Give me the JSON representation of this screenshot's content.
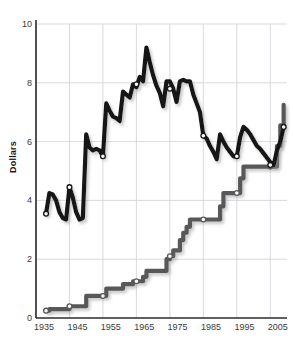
{
  "chart_data": {
    "type": "line",
    "title": "",
    "xlabel": "",
    "ylabel": "Dollars",
    "xlim": [
      1935,
      2010
    ],
    "ylim": [
      0,
      10
    ],
    "grid": true,
    "legend": "none",
    "xticks": [
      1935,
      1945,
      1955,
      1965,
      1975,
      1985,
      1995,
      2005
    ],
    "yticks": [
      0,
      2,
      4,
      6,
      8,
      10
    ],
    "colors": {
      "real_line": "#161616",
      "nominal_line": "#595959",
      "marker_fill": "#ffffff",
      "grid": "#cfcfd8",
      "axis": "#2b2b2b",
      "text": "#333333"
    },
    "series": [
      {
        "name": "Real (inflation-adjusted) minimum wage",
        "color": "#161616",
        "style": "line",
        "x": [
          1938,
          1939,
          1940,
          1941,
          1942,
          1943,
          1944,
          1945,
          1946,
          1947,
          1948,
          1949,
          1950,
          1951,
          1952,
          1953,
          1954,
          1955,
          1956,
          1957,
          1958,
          1959,
          1960,
          1961,
          1962,
          1963,
          1964,
          1965,
          1966,
          1967,
          1968,
          1969,
          1970,
          1971,
          1972,
          1973,
          1974,
          1975,
          1976,
          1977,
          1978,
          1979,
          1980,
          1981,
          1982,
          1983,
          1984,
          1985,
          1986,
          1987,
          1988,
          1989,
          1990,
          1991,
          1992,
          1993,
          1994,
          1995,
          1996,
          1997,
          1998,
          1999,
          2000,
          2001,
          2002,
          2003,
          2004,
          2005,
          2006,
          2007,
          2008,
          2009
        ],
        "y": [
          3.55,
          4.25,
          4.2,
          4.0,
          3.6,
          3.4,
          3.35,
          4.45,
          4.1,
          3.6,
          3.35,
          3.4,
          6.25,
          5.8,
          5.7,
          5.75,
          5.7,
          5.5,
          7.3,
          7.05,
          6.85,
          6.8,
          6.7,
          7.7,
          7.6,
          7.5,
          7.95,
          7.85,
          8.2,
          8.05,
          9.2,
          8.7,
          8.25,
          7.9,
          7.65,
          7.2,
          8.05,
          8.05,
          7.8,
          7.35,
          8.05,
          8.1,
          8.05,
          8.05,
          7.6,
          7.3,
          7.0,
          6.2,
          6.1,
          5.85,
          5.65,
          5.4,
          6.25,
          6.0,
          5.8,
          5.65,
          5.5,
          5.5,
          6.15,
          6.5,
          6.4,
          6.25,
          6.05,
          5.85,
          5.75,
          5.6,
          5.45,
          5.3,
          5.2,
          5.7,
          6.0,
          6.5
        ]
      },
      {
        "name": "Nominal minimum wage",
        "color": "#595959",
        "style": "step",
        "x": [
          1938,
          1939,
          1940,
          1941,
          1942,
          1943,
          1944,
          1945,
          1946,
          1947,
          1948,
          1949,
          1950,
          1951,
          1952,
          1953,
          1954,
          1955,
          1956,
          1957,
          1958,
          1959,
          1960,
          1961,
          1962,
          1963,
          1964,
          1965,
          1966,
          1967,
          1968,
          1969,
          1970,
          1971,
          1972,
          1973,
          1974,
          1975,
          1976,
          1977,
          1978,
          1979,
          1980,
          1981,
          1982,
          1983,
          1984,
          1985,
          1986,
          1987,
          1988,
          1989,
          1990,
          1991,
          1992,
          1993,
          1994,
          1995,
          1996,
          1997,
          1998,
          1999,
          2000,
          2001,
          2002,
          2003,
          2004,
          2005,
          2006,
          2007,
          2008,
          2009
        ],
        "y": [
          0.25,
          0.3,
          0.3,
          0.3,
          0.3,
          0.3,
          0.3,
          0.4,
          0.4,
          0.4,
          0.4,
          0.4,
          0.75,
          0.75,
          0.75,
          0.75,
          0.75,
          0.75,
          1.0,
          1.0,
          1.0,
          1.0,
          1.0,
          1.15,
          1.15,
          1.15,
          1.25,
          1.25,
          1.25,
          1.4,
          1.6,
          1.6,
          1.6,
          1.6,
          1.6,
          1.6,
          2.0,
          2.1,
          2.3,
          2.3,
          2.65,
          2.9,
          3.1,
          3.35,
          3.35,
          3.35,
          3.35,
          3.35,
          3.35,
          3.35,
          3.35,
          3.35,
          3.8,
          4.25,
          4.25,
          4.25,
          4.25,
          4.25,
          4.75,
          5.15,
          5.15,
          5.15,
          5.15,
          5.15,
          5.15,
          5.15,
          5.15,
          5.15,
          5.15,
          5.85,
          6.55,
          7.25
        ]
      }
    ],
    "markers": {
      "real": [
        {
          "x": 1938,
          "y": 3.55
        },
        {
          "x": 1945,
          "y": 4.45
        },
        {
          "x": 1955,
          "y": 5.5
        },
        {
          "x": 1965,
          "y": 7.95
        },
        {
          "x": 1975,
          "y": 7.8
        },
        {
          "x": 1985,
          "y": 6.2
        },
        {
          "x": 1995,
          "y": 5.5
        },
        {
          "x": 2005,
          "y": 5.2
        },
        {
          "x": 2009,
          "y": 6.5
        }
      ],
      "nominal": [
        {
          "x": 1938,
          "y": 0.25
        },
        {
          "x": 1945,
          "y": 0.4
        },
        {
          "x": 1955,
          "y": 0.75
        },
        {
          "x": 1965,
          "y": 1.25
        },
        {
          "x": 1975,
          "y": 2.1
        },
        {
          "x": 1985,
          "y": 3.35
        },
        {
          "x": 1995,
          "y": 4.25
        },
        {
          "x": 2005,
          "y": 5.15
        }
      ]
    }
  },
  "axis": {
    "y_label": "Dollars",
    "y_tick_labels": [
      "0",
      "2",
      "4",
      "6",
      "8",
      "10"
    ],
    "x_tick_labels": [
      "1935",
      "1945",
      "1955",
      "1965",
      "1975",
      "1985",
      "1995",
      "2005"
    ]
  }
}
